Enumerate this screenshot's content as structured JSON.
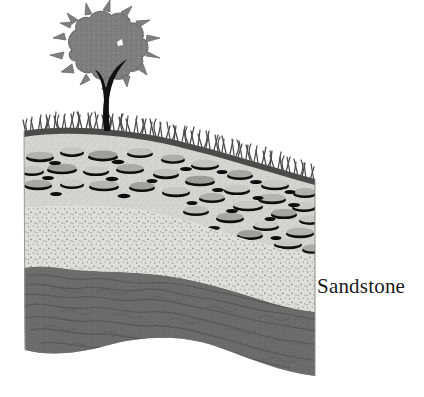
{
  "figure": {
    "kind": "geologic-block-diagram",
    "background_color": "#ffffff",
    "width": 424,
    "height": 397
  },
  "labels": {
    "sandstone": "Sandstone"
  },
  "surface": {
    "tree": {
      "name": "tree",
      "canopy_color": "#7e7e7e",
      "canopy_outline_color": "#6a6a6a",
      "trunk_color": "#111111",
      "highlight_color": "#ffffff"
    },
    "grass": {
      "name": "grass",
      "color": "#4a4a4a",
      "blade_count": 150
    }
  },
  "strata": [
    {
      "id": "conglomerate",
      "name": "conglomerate-layer",
      "matrix_color": "#d5d5d2",
      "pebble_color": "#a8a8a4",
      "pebble_shadow_color": "#101010",
      "side_color": "#c9c9c6"
    },
    {
      "id": "sandstone",
      "name": "sandstone-layer",
      "fill_color": "#dcdcd8",
      "stipple_color": "#8e8e8a",
      "label": "Sandstone"
    },
    {
      "id": "shale",
      "name": "shale-layer",
      "fill_color": "#6e6e6e",
      "wave_line_color": "#565656"
    }
  ],
  "colors": {
    "text": "#1a1a1a",
    "page_background": "#ffffff"
  }
}
